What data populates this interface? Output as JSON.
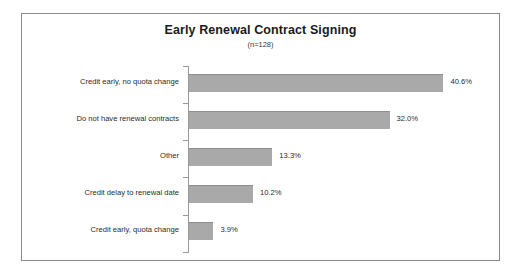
{
  "chart": {
    "title": "Early Renewal Contract Signing",
    "subtitle": "(n=128)"
  },
  "chart_data": {
    "type": "bar",
    "orientation": "horizontal",
    "title": "Early Renewal Contract Signing",
    "subtitle": "(n=128)",
    "sample_size": 128,
    "xlabel": "",
    "ylabel": "",
    "xlim": [
      0,
      45
    ],
    "grid": false,
    "legend": false,
    "bar_color": "#a9a9a9",
    "categories": [
      "Credit early, no quota change",
      "Do not have renewal contracts",
      "Other",
      "Credit delay to renewal date",
      "Credit early, quota change"
    ],
    "values": [
      40.6,
      32.0,
      13.3,
      10.2,
      3.9
    ],
    "value_labels": [
      "40.6%",
      "32.0%",
      "13.3%",
      "10.2%",
      "3.9%"
    ]
  }
}
